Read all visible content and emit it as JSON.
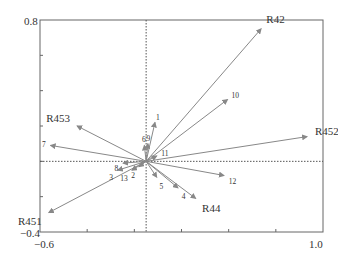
{
  "chart_data": {
    "type": "scatter",
    "subtype": "biplot-vectors",
    "title": "",
    "xlabel": "",
    "ylabel": "",
    "xlim": [
      -0.6,
      1.0
    ],
    "ylim": [
      -0.4,
      0.8
    ],
    "x_tick_labels": [
      "-0.6",
      "1.0"
    ],
    "y_tick_labels": [
      "0.8",
      "-0.4"
    ],
    "grid": false,
    "reference_lines": {
      "x0": true,
      "y0": true,
      "style": "dotted"
    },
    "series": [
      {
        "name": "environment",
        "style": "large-label",
        "points": [
          {
            "label": "R42",
            "x": 0.65,
            "y": 0.75
          },
          {
            "label": "R452",
            "x": 0.91,
            "y": 0.14
          },
          {
            "label": "R453",
            "x": -0.39,
            "y": 0.2
          },
          {
            "label": "R451",
            "x": -0.55,
            "y": -0.29
          },
          {
            "label": "R44",
            "x": 0.28,
            "y": -0.21
          }
        ]
      },
      {
        "name": "species",
        "style": "small-label",
        "points": [
          {
            "label": "1",
            "x": 0.05,
            "y": 0.22
          },
          {
            "label": "2",
            "x": -0.04,
            "y": -0.03
          },
          {
            "label": "3",
            "x": -0.16,
            "y": -0.05
          },
          {
            "label": "4",
            "x": 0.18,
            "y": -0.15
          },
          {
            "label": "5",
            "x": 0.06,
            "y": -0.09
          },
          {
            "label": "6",
            "x": -0.01,
            "y": 0.09
          },
          {
            "label": "7",
            "x": -0.54,
            "y": 0.09
          },
          {
            "label": "8",
            "x": -0.13,
            "y": -0.01
          },
          {
            "label": "9",
            "x": 0.01,
            "y": 0.1
          },
          {
            "label": "10",
            "x": 0.46,
            "y": 0.35
          },
          {
            "label": "11",
            "x": 0.06,
            "y": 0.03
          },
          {
            "label": "12",
            "x": 0.44,
            "y": -0.08
          },
          {
            "label": "13",
            "x": -0.08,
            "y": -0.05
          }
        ]
      }
    ]
  },
  "axes": {
    "x_min_label": "-0.6",
    "x_max_label": "1.0",
    "y_max_label": "0.8",
    "y_min_label": "-0.4"
  }
}
